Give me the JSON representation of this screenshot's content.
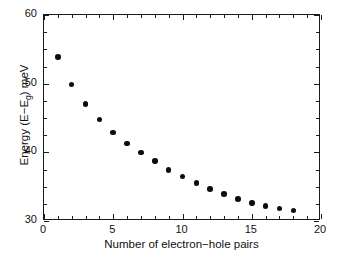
{
  "chart_data": {
    "type": "scatter",
    "title": "",
    "xlabel": "Number of electron−hole pairs",
    "ylabel_parts": {
      "prefix": "Energy (E−E",
      "subscript": "g",
      "suffix": ") meV"
    },
    "ylabel": "Energy (E−Eg) meV",
    "xlim": [
      0,
      20
    ],
    "ylim": [
      30,
      60
    ],
    "xticks": [
      0,
      5,
      10,
      15,
      20
    ],
    "xticklabels": [
      "0",
      "5",
      "10",
      "15",
      "20"
    ],
    "xticks_minor": [
      1,
      2,
      3,
      4,
      6,
      7,
      8,
      9,
      11,
      12,
      13,
      14,
      16,
      17,
      18,
      19
    ],
    "yticks": [
      30,
      40,
      50,
      60
    ],
    "yticklabels": [
      "30",
      "40",
      "50",
      "60"
    ],
    "yticks_minor": [
      32.5,
      35,
      37.5,
      42.5,
      45,
      47.5,
      52.5,
      55,
      57.5
    ],
    "grid": false,
    "legend": null,
    "marker": "filled-circle",
    "marker_color": "#0d0d0d",
    "marker_size_px": 5.6,
    "frame_color": "#1a1a1a",
    "background_color": "#ffffff",
    "x": [
      1,
      2,
      3,
      4,
      5,
      6,
      7,
      8,
      9,
      10,
      11,
      12,
      13,
      14,
      15,
      16,
      17,
      18
    ],
    "values": [
      53.9,
      49.9,
      47.0,
      44.8,
      42.9,
      41.3,
      40.0,
      38.7,
      37.4,
      36.5,
      35.5,
      34.7,
      33.9,
      33.2,
      32.6,
      32.2,
      31.8,
      31.5
    ],
    "series": [
      {
        "name": "Energy vs electron-hole pairs",
        "x": [
          1,
          2,
          3,
          4,
          5,
          6,
          7,
          8,
          9,
          10,
          11,
          12,
          13,
          14,
          15,
          16,
          17,
          18
        ],
        "values": [
          53.9,
          49.9,
          47.0,
          44.8,
          42.9,
          41.3,
          40.0,
          38.7,
          37.4,
          36.5,
          35.5,
          34.7,
          33.9,
          33.2,
          32.6,
          32.2,
          31.8,
          31.5
        ]
      }
    ]
  }
}
